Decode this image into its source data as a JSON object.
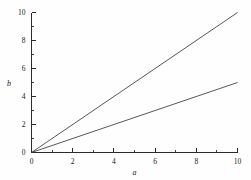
{
  "chart_data": {
    "type": "line",
    "title": "",
    "subtitle": "",
    "xlabel": "a",
    "ylabel": "b",
    "xlim": [
      0,
      10
    ],
    "ylim": [
      0,
      10
    ],
    "grid": false,
    "legend": null,
    "x_ticks": [
      0,
      1,
      2,
      3,
      4,
      5,
      6,
      7,
      8,
      9,
      10
    ],
    "x_tick_labels": [
      "0",
      "",
      "2",
      "",
      "4",
      "",
      "6",
      "",
      "8",
      "",
      "10"
    ],
    "y_ticks": [
      0,
      1,
      2,
      3,
      4,
      5,
      6,
      7,
      8,
      9,
      10
    ],
    "y_tick_labels": [
      "0",
      "",
      "2",
      "",
      "4",
      "",
      "6",
      "",
      "8",
      "",
      "10"
    ],
    "x": [
      0,
      10
    ],
    "series": [
      {
        "name": "b = a",
        "slope": 1.0,
        "intercept": 0,
        "color": "#3a3a3a",
        "values": [
          0,
          10
        ]
      },
      {
        "name": "b = 0.5a",
        "slope": 0.5,
        "intercept": 0,
        "color": "#3a3a3a",
        "values": [
          0,
          5
        ]
      }
    ]
  }
}
